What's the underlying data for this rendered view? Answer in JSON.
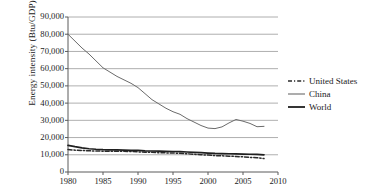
{
  "chart_data": {
    "type": "line",
    "title": "",
    "xlabel": "",
    "ylabel": "Energy intensity (Btu/GDP)",
    "xlim": [
      1980,
      2010
    ],
    "ylim": [
      0,
      90000
    ],
    "grid": "horizontal",
    "legend_position": "right",
    "xticks": [
      "1980",
      "1985",
      "1990",
      "1995",
      "2000",
      "2005",
      "2010"
    ],
    "xtick_values": [
      1980,
      1985,
      1990,
      1995,
      2000,
      2005,
      2010
    ],
    "yticks": [
      "0",
      "10,000",
      "20,000",
      "30,000",
      "40,000",
      "50,000",
      "60,000",
      "70,000",
      "80,000",
      "90,000"
    ],
    "ytick_values": [
      0,
      10000,
      20000,
      30000,
      40000,
      50000,
      60000,
      70000,
      80000,
      90000
    ],
    "x": [
      1980,
      1981,
      1982,
      1983,
      1984,
      1985,
      1986,
      1987,
      1988,
      1989,
      1990,
      1991,
      1992,
      1993,
      1994,
      1995,
      1996,
      1997,
      1998,
      1999,
      2000,
      2001,
      2002,
      2003,
      2004,
      2005,
      2006,
      2007,
      2008
    ],
    "series": [
      {
        "name": "United States",
        "style": "dashed",
        "color": "#2b2b2b",
        "values": [
          13000,
          12700,
          12500,
          12300,
          12200,
          12100,
          12000,
          12000,
          12000,
          11900,
          11700,
          11500,
          11400,
          11200,
          11100,
          11000,
          10900,
          10600,
          10300,
          10000,
          9800,
          9500,
          9400,
          9200,
          9000,
          8800,
          8500,
          8300,
          7800
        ]
      },
      {
        "name": "China",
        "style": "solid-thin",
        "color": "#6b6b6b",
        "values": [
          80000,
          76000,
          72000,
          68500,
          64500,
          60500,
          58000,
          55500,
          53500,
          51500,
          49000,
          45500,
          42000,
          39500,
          37000,
          35000,
          33500,
          31000,
          29000,
          27000,
          25500,
          25200,
          26200,
          28500,
          30500,
          29500,
          28200,
          26300,
          26500
        ]
      },
      {
        "name": "World",
        "style": "solid-thick",
        "color": "#1f1f1f",
        "values": [
          15500,
          14700,
          14000,
          13500,
          13200,
          13000,
          12900,
          12800,
          12700,
          12600,
          12500,
          12300,
          12200,
          12100,
          12000,
          11900,
          11800,
          11600,
          11400,
          11200,
          11000,
          10800,
          10700,
          10600,
          10500,
          10400,
          10300,
          10200,
          10000
        ]
      }
    ]
  },
  "legend": {
    "items": [
      {
        "label": "United States",
        "sample": "dashed"
      },
      {
        "label": "China",
        "sample": "solid-thin"
      },
      {
        "label": "World",
        "sample": "solid-thick"
      }
    ]
  }
}
